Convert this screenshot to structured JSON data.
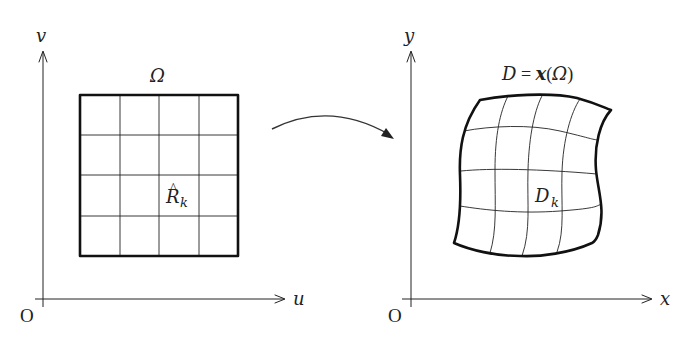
{
  "diagram": {
    "left_panel": {
      "origin_label": "O",
      "horizontal_axis_label": "u",
      "vertical_axis_label": "v",
      "domain_label": "Ω",
      "cell_label_main": "R",
      "cell_label_hat": "^",
      "cell_label_sub": "k",
      "grid": {
        "rows": 4,
        "cols": 4
      }
    },
    "mapping_arrow": {
      "direction": "left-to-right"
    },
    "right_panel": {
      "origin_label": "O",
      "horizontal_axis_label": "x",
      "vertical_axis_label": "y",
      "domain_label_lhs": "D",
      "domain_label_eq": " = ",
      "domain_label_func": "x",
      "domain_label_open": "(",
      "domain_label_arg": "Ω",
      "domain_label_close": ")",
      "cell_label_main": "D",
      "cell_label_sub": "k",
      "grid": {
        "rows": 4,
        "cols": 4
      }
    },
    "colors": {
      "line": "#222222",
      "background": "#ffffff"
    }
  }
}
